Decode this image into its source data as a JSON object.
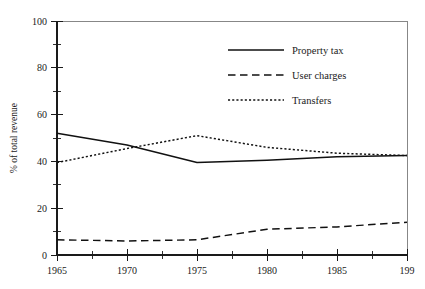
{
  "chart_data": {
    "type": "line",
    "title": "",
    "subtitle": "",
    "xlabel": "",
    "ylabel": "% of total revenue",
    "x": [
      1965,
      1970,
      1975,
      1980,
      1985,
      1990
    ],
    "xlim": [
      1965,
      1990
    ],
    "ylim": [
      0,
      100
    ],
    "grid": false,
    "legend_position": "top-right",
    "x_tick_labels": [
      "1965",
      "1970",
      "1975",
      "1980",
      "1985",
      "199"
    ],
    "y_tick_labels": [
      "0",
      "20",
      "40",
      "60",
      "80",
      "100"
    ],
    "y_major_ticks": [
      0,
      20,
      40,
      60,
      80,
      100
    ],
    "y_minor_ticks": [
      10,
      30,
      50,
      70,
      90
    ],
    "x_major_ticks": [
      1965,
      1970,
      1975,
      1980,
      1985,
      1990
    ],
    "x_minor_ticks": [
      1967.5,
      1972.5,
      1977.5,
      1982.5,
      1987.5
    ],
    "series": [
      {
        "name": "Property tax",
        "style": "solid",
        "color": "#111111",
        "values": [
          52,
          47,
          39.5,
          40.5,
          42,
          42.5
        ]
      },
      {
        "name": "User charges",
        "style": "dashed",
        "color": "#111111",
        "values": [
          6.5,
          6,
          6.5,
          11,
          12,
          14
        ]
      },
      {
        "name": "Transfers",
        "style": "dotted",
        "color": "#111111",
        "values": [
          39.5,
          45.5,
          51,
          46,
          43.5,
          42.5
        ]
      }
    ]
  },
  "legend": {
    "items": [
      {
        "label": "Property tax",
        "style": "solid"
      },
      {
        "label": "User charges",
        "style": "dashed"
      },
      {
        "label": "Transfers",
        "style": "dotted"
      }
    ]
  },
  "axes": {
    "y_title": "% of total revenue"
  }
}
